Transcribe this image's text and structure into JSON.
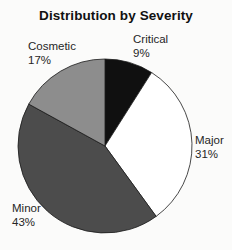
{
  "chart_data": {
    "type": "pie",
    "title": "Distribution by Severity",
    "start_angle_deg": 0,
    "direction": "clockwise",
    "outline_color": "#1a1a1a",
    "background_color": "#fbfbfa",
    "legend_position": "labels-around-pie",
    "slices": [
      {
        "label": "Critical",
        "value": 9,
        "display": "9%",
        "color": "#101010"
      },
      {
        "label": "Major",
        "value": 31,
        "display": "31%",
        "color": "#ffffff"
      },
      {
        "label": "Minor",
        "value": 43,
        "display": "43%",
        "color": "#4c4c4c"
      },
      {
        "label": "Cosmetic",
        "value": 17,
        "display": "17%",
        "color": "#8d8d8d"
      }
    ]
  }
}
